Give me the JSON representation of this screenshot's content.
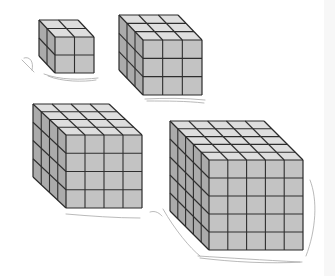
{
  "figure": {
    "colors": {
      "front": "#c3c3c3",
      "top": "#dedede",
      "side": "#ababab",
      "line": "#2e2e2e",
      "sketch": "#a9a9a9",
      "background": "#ffffff"
    },
    "cubes": [
      {
        "name": "cube-2x2x2",
        "n": 2,
        "front": [
          55,
          37,
          94,
          73
        ],
        "depth": [
          -16,
          -17
        ]
      },
      {
        "name": "cube-3x3x3",
        "n": 3,
        "front": [
          143,
          40,
          202,
          95
        ],
        "depth": [
          -24,
          -25
        ]
      },
      {
        "name": "cube-4x4x4",
        "n": 4,
        "front": [
          66,
          135,
          142,
          208
        ],
        "depth": [
          -33,
          -31
        ]
      },
      {
        "name": "cube-5x5x5",
        "n": 5,
        "front": [
          209,
          160,
          303,
          250
        ],
        "depth": [
          -39,
          -39
        ]
      }
    ]
  }
}
